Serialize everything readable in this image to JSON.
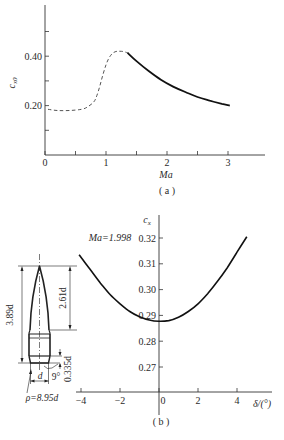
{
  "figure": {
    "caption_a": "( a )",
    "caption_b": "( b )"
  },
  "chart_data": [
    {
      "id": "a",
      "type": "line",
      "title": "",
      "xlabel": "Ma",
      "ylabel": "c_x0",
      "ylabel_main": "c",
      "ylabel_sub": "x0",
      "xlim": [
        0,
        3.6
      ],
      "ylim": [
        0,
        0.6
      ],
      "x_ticks": [
        0,
        0.5,
        1,
        1.5,
        2,
        2.5,
        3
      ],
      "x_tick_labels": [
        "0",
        "",
        "1",
        "",
        "2",
        "",
        "3"
      ],
      "y_ticks": [
        0.1,
        0.2,
        0.3,
        0.4,
        0.5
      ],
      "y_tick_labels": [
        "",
        "0.20",
        "",
        "0.40",
        ""
      ],
      "grid": false,
      "series": [
        {
          "name": "estimated (dashed)",
          "style": "dashed",
          "x": [
            0.05,
            0.2,
            0.4,
            0.6,
            0.7,
            0.8,
            0.85,
            0.9,
            0.95,
            1.0,
            1.05,
            1.1,
            1.15,
            1.2,
            1.25,
            1.3,
            1.35
          ],
          "y": [
            0.185,
            0.18,
            0.18,
            0.185,
            0.195,
            0.215,
            0.24,
            0.28,
            0.325,
            0.365,
            0.393,
            0.41,
            0.418,
            0.42,
            0.42,
            0.418,
            0.414
          ]
        },
        {
          "name": "measured (solid)",
          "style": "solid",
          "x": [
            1.35,
            1.5,
            1.7,
            1.9,
            2.1,
            2.3,
            2.5,
            2.7,
            2.9,
            3.03
          ],
          "y": [
            0.414,
            0.38,
            0.34,
            0.305,
            0.277,
            0.255,
            0.235,
            0.22,
            0.207,
            0.2
          ]
        }
      ]
    },
    {
      "id": "b",
      "type": "line",
      "title": "",
      "xlabel": "δ/(°)",
      "ylabel": "c_x",
      "ylabel_main": "c",
      "ylabel_sub": "x",
      "annotation": "Ma=1.998",
      "xlim": [
        -4.2,
        5.5
      ],
      "ylim": [
        0.26,
        0.33
      ],
      "x_ticks": [
        -4,
        -2,
        0,
        2,
        4
      ],
      "x_tick_labels": [
        "−4",
        "−2",
        "0",
        "2",
        "4"
      ],
      "y_ticks": [
        0.27,
        0.28,
        0.29,
        0.3,
        0.31,
        0.32
      ],
      "y_tick_labels": [
        "0.27",
        "0.28",
        "0.29",
        "0.30",
        "0.31",
        "0.32"
      ],
      "grid": false,
      "series": [
        {
          "name": "c_x vs δ",
          "style": "solid",
          "x": [
            -4.1,
            -3.5,
            -3.0,
            -2.5,
            -2.0,
            -1.5,
            -1.0,
            -0.5,
            0,
            0.5,
            1.0,
            1.5,
            2.0,
            2.5,
            3.0,
            3.5,
            4.0,
            4.5
          ],
          "y": [
            0.3135,
            0.3075,
            0.3025,
            0.298,
            0.2945,
            0.2915,
            0.2895,
            0.2882,
            0.2877,
            0.288,
            0.2893,
            0.2915,
            0.2945,
            0.2985,
            0.3032,
            0.3085,
            0.3145,
            0.3205
          ]
        }
      ]
    }
  ],
  "projectile": {
    "total_length": "3.89d",
    "nose_length": "2.61d",
    "boattail_length": "0.335d",
    "diameter": "d",
    "boattail_angle": "9°",
    "ogive_radius": "ρ=8.95d"
  }
}
